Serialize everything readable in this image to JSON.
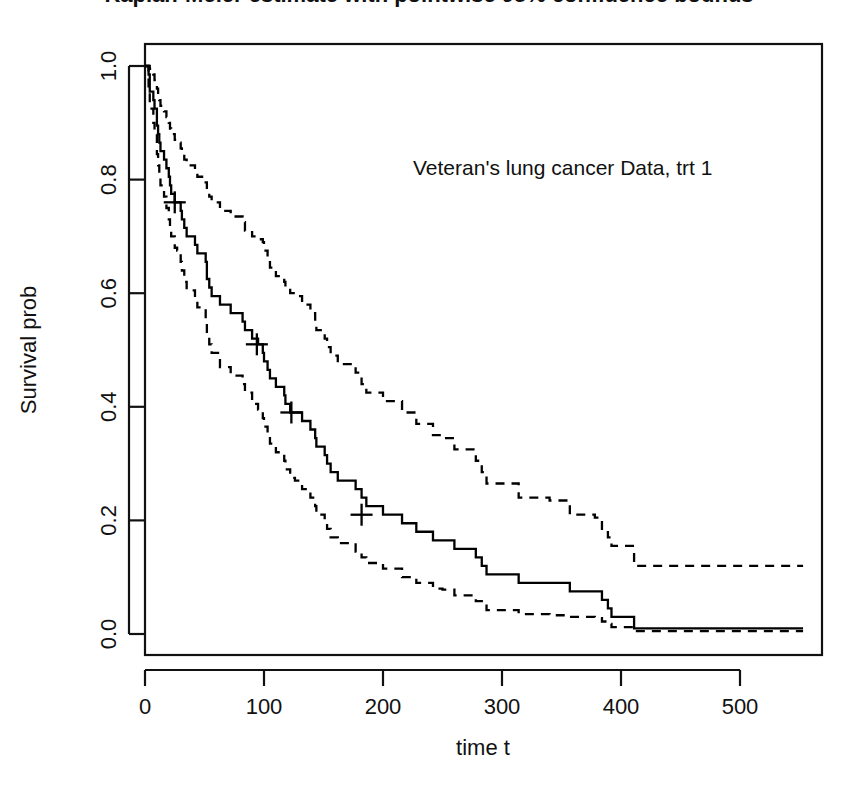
{
  "chart_data": {
    "type": "line",
    "title": "Kaplan-Meier estimate with pointwise 95% confidence bounds",
    "annotation": "Veteran's lung cancer Data, trt 1",
    "xlabel": "time t",
    "ylabel": "Survival prob",
    "xlim": [
      0,
      553
    ],
    "ylim": [
      0.0,
      1.0
    ],
    "xticks": [
      0,
      100,
      200,
      300,
      400,
      500
    ],
    "xtick_labels": [
      "0",
      "100",
      "200",
      "300",
      "400",
      "500"
    ],
    "yticks": [
      0.0,
      0.2,
      0.4,
      0.6,
      0.8,
      1.0
    ],
    "ytick_labels": [
      "0.0",
      "0.2",
      "0.4",
      "0.6",
      "0.8",
      "1.0"
    ],
    "grid": false,
    "legend": "none",
    "step_type": "post",
    "series": [
      {
        "name": "Survival estimate",
        "style": "solid",
        "x": [
          0,
          3,
          4,
          7,
          8,
          10,
          11,
          12,
          13,
          16,
          18,
          20,
          21,
          22,
          24,
          25,
          27,
          30,
          31,
          33,
          35,
          42,
          44,
          51,
          52,
          54,
          56,
          59,
          63,
          72,
          82,
          84,
          87,
          90,
          92,
          95,
          99,
          100,
          103,
          105,
          110,
          117,
          118,
          122,
          126,
          132,
          139,
          143,
          144,
          151,
          153,
          156,
          162,
          177,
          182,
          186,
          200,
          201,
          216,
          228,
          231,
          242,
          250,
          260,
          278,
          283,
          287,
          314,
          340,
          357,
          378,
          384,
          389,
          392,
          411,
          467,
          553
        ],
        "y": [
          1.0,
          0.985,
          0.955,
          0.94,
          0.925,
          0.895,
          0.88,
          0.865,
          0.85,
          0.835,
          0.82,
          0.805,
          0.79,
          0.775,
          0.775,
          0.76,
          0.76,
          0.745,
          0.73,
          0.715,
          0.7,
          0.685,
          0.67,
          0.655,
          0.625,
          0.61,
          0.595,
          0.595,
          0.58,
          0.565,
          0.55,
          0.535,
          0.535,
          0.52,
          0.52,
          0.51,
          0.495,
          0.48,
          0.465,
          0.45,
          0.435,
          0.42,
          0.405,
          0.39,
          0.39,
          0.375,
          0.36,
          0.345,
          0.33,
          0.315,
          0.3,
          0.285,
          0.27,
          0.255,
          0.24,
          0.225,
          0.21,
          0.21,
          0.195,
          0.18,
          0.18,
          0.165,
          0.165,
          0.15,
          0.135,
          0.12,
          0.105,
          0.09,
          0.09,
          0.075,
          0.075,
          0.06,
          0.045,
          0.03,
          0.01,
          0.01,
          0.01
        ]
      },
      {
        "name": "Upper 95% confidence bound",
        "style": "dashed",
        "x": [
          0,
          3,
          4,
          7,
          8,
          10,
          11,
          12,
          13,
          16,
          18,
          20,
          21,
          22,
          25,
          27,
          30,
          31,
          33,
          35,
          42,
          44,
          51,
          52,
          54,
          56,
          63,
          72,
          82,
          84,
          90,
          95,
          99,
          100,
          103,
          105,
          110,
          117,
          118,
          122,
          126,
          132,
          139,
          143,
          144,
          151,
          153,
          156,
          162,
          177,
          182,
          186,
          200,
          216,
          228,
          242,
          250,
          260,
          278,
          283,
          287,
          314,
          340,
          357,
          378,
          384,
          389,
          392,
          411,
          467,
          553
        ],
        "y": [
          1.0,
          1.0,
          0.995,
          0.985,
          0.975,
          0.96,
          0.95,
          0.94,
          0.93,
          0.92,
          0.91,
          0.9,
          0.89,
          0.88,
          0.87,
          0.865,
          0.855,
          0.845,
          0.835,
          0.825,
          0.815,
          0.805,
          0.795,
          0.78,
          0.77,
          0.76,
          0.745,
          0.735,
          0.725,
          0.71,
          0.7,
          0.695,
          0.69,
          0.675,
          0.66,
          0.645,
          0.63,
          0.62,
          0.61,
          0.6,
          0.595,
          0.58,
          0.565,
          0.55,
          0.535,
          0.52,
          0.505,
          0.49,
          0.475,
          0.46,
          0.44,
          0.425,
          0.41,
          0.39,
          0.37,
          0.35,
          0.345,
          0.325,
          0.305,
          0.285,
          0.265,
          0.24,
          0.235,
          0.21,
          0.205,
          0.185,
          0.17,
          0.155,
          0.12,
          0.12,
          0.12
        ]
      },
      {
        "name": "Lower 95% confidence bound",
        "style": "dashed",
        "x": [
          0,
          3,
          4,
          7,
          8,
          10,
          11,
          12,
          13,
          16,
          18,
          20,
          21,
          22,
          25,
          27,
          30,
          31,
          33,
          35,
          42,
          44,
          51,
          52,
          54,
          56,
          63,
          72,
          82,
          84,
          90,
          95,
          99,
          100,
          103,
          105,
          110,
          117,
          118,
          122,
          126,
          132,
          139,
          143,
          144,
          151,
          153,
          156,
          162,
          177,
          182,
          186,
          200,
          216,
          228,
          242,
          250,
          260,
          278,
          283,
          287,
          314,
          340,
          357,
          378,
          384,
          389,
          392,
          411,
          467,
          553
        ],
        "y": [
          1.0,
          0.96,
          0.925,
          0.9,
          0.88,
          0.845,
          0.825,
          0.805,
          0.79,
          0.77,
          0.75,
          0.73,
          0.715,
          0.7,
          0.68,
          0.675,
          0.655,
          0.64,
          0.62,
          0.605,
          0.59,
          0.575,
          0.555,
          0.525,
          0.51,
          0.495,
          0.47,
          0.455,
          0.44,
          0.425,
          0.405,
          0.395,
          0.38,
          0.365,
          0.35,
          0.335,
          0.32,
          0.305,
          0.29,
          0.275,
          0.27,
          0.255,
          0.24,
          0.225,
          0.21,
          0.2,
          0.185,
          0.17,
          0.16,
          0.145,
          0.135,
          0.125,
          0.115,
          0.1,
          0.09,
          0.08,
          0.078,
          0.068,
          0.058,
          0.05,
          0.042,
          0.035,
          0.033,
          0.03,
          0.028,
          0.022,
          0.018,
          0.012,
          0.005,
          0.005,
          0.005
        ]
      }
    ],
    "censor_marks": [
      {
        "x": 25,
        "y": 0.76
      },
      {
        "x": 94,
        "y": 0.51
      },
      {
        "x": 123,
        "y": 0.39
      },
      {
        "x": 182,
        "y": 0.21
      }
    ]
  }
}
